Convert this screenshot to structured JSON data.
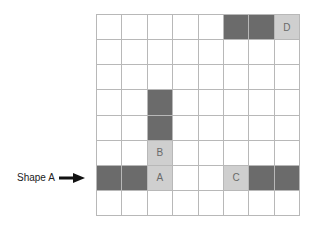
{
  "diagram": {
    "rows": 8,
    "cols": 8,
    "colors": {
      "dark": "#6b6b6b",
      "light": "#cfcfcf",
      "empty": "#ffffff",
      "gridline": "#b8b8b8"
    },
    "cells": [
      {
        "row": 0,
        "col": 5,
        "fill": "dark",
        "text": ""
      },
      {
        "row": 0,
        "col": 6,
        "fill": "dark",
        "text": ""
      },
      {
        "row": 0,
        "col": 7,
        "fill": "light",
        "text": "D"
      },
      {
        "row": 3,
        "col": 2,
        "fill": "dark",
        "text": ""
      },
      {
        "row": 4,
        "col": 2,
        "fill": "dark",
        "text": ""
      },
      {
        "row": 5,
        "col": 2,
        "fill": "light",
        "text": "B"
      },
      {
        "row": 6,
        "col": 0,
        "fill": "dark",
        "text": ""
      },
      {
        "row": 6,
        "col": 1,
        "fill": "dark",
        "text": ""
      },
      {
        "row": 6,
        "col": 2,
        "fill": "light",
        "text": "A"
      },
      {
        "row": 6,
        "col": 5,
        "fill": "light",
        "text": "C"
      },
      {
        "row": 6,
        "col": 6,
        "fill": "dark",
        "text": ""
      },
      {
        "row": 6,
        "col": 7,
        "fill": "dark",
        "text": ""
      }
    ],
    "pointer": {
      "label": "Shape A",
      "points_to_row": 6
    }
  }
}
